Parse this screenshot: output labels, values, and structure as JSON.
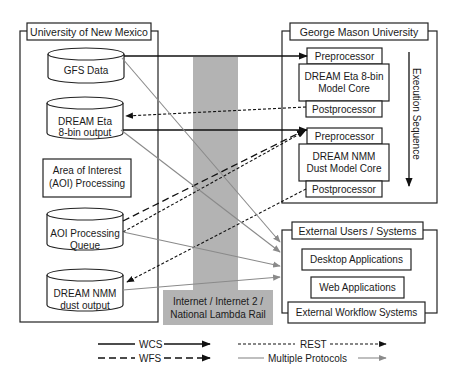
{
  "diagram": {
    "unm": {
      "title": "University of New Mexico",
      "gfs": "GFS Data",
      "eta_output": [
        "DREAM Eta",
        "8-bin output"
      ],
      "aoi_processing": [
        "Area of Interest",
        "(AOI) Processing"
      ],
      "aoi_queue": [
        "AOI Processing",
        "Queue"
      ],
      "nmm_output": [
        "DREAM NMM",
        "dust output"
      ]
    },
    "network": {
      "label": [
        "Internet / Internet 2 /",
        "National Lambda Rail"
      ],
      "color": "#b3b3b3"
    },
    "gmu": {
      "title": "George Mason University",
      "eta_model": {
        "pre": "Preprocessor",
        "core": [
          "DREAM Eta 8-bin",
          "Model Core"
        ],
        "post": "Postprocessor"
      },
      "nmm_model": {
        "pre": "Preprocessor",
        "core": [
          "DREAM NMM",
          "Dust Model Core"
        ],
        "post": "Postprocessor"
      },
      "execution": "Execution Sequence"
    },
    "external": {
      "title": "External Users / Systems",
      "items": [
        "Desktop Applications",
        "Web Applications",
        "External Workflow Systems"
      ]
    },
    "legend": {
      "wcs": "WCS",
      "wfs": "WFS",
      "rest": "REST",
      "multi": "Multiple Protocols",
      "multi_color": "#8a8a8a"
    }
  }
}
